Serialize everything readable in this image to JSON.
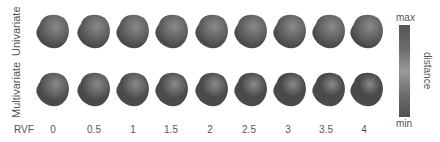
{
  "rows": [
    {
      "label": "Univariate"
    },
    {
      "label": "Multivariate"
    }
  ],
  "rvf": {
    "title": "RVF",
    "values": [
      "0",
      "0.5",
      "1",
      "1.5",
      "2",
      "2.5",
      "3",
      "3.5",
      "4"
    ]
  },
  "colorbar": {
    "title": "distance",
    "max_label": "max",
    "min_label": "min"
  }
}
